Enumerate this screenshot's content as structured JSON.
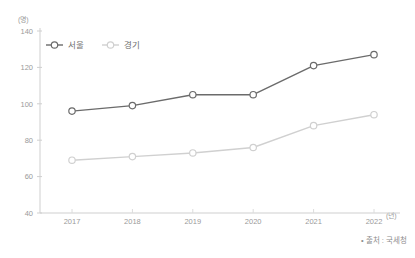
{
  "chart_data": {
    "type": "line",
    "title": "",
    "subtitle": "",
    "xlabel": "(년)",
    "ylabel": "(명)",
    "categories": [
      "2017",
      "2018",
      "2019",
      "2020",
      "2021",
      "2022"
    ],
    "series": [
      {
        "name": "서울",
        "color": "#6b6b6b",
        "values": [
          96,
          99,
          105,
          105,
          121,
          127
        ]
      },
      {
        "name": "경기",
        "color": "#d0d0d0",
        "values": [
          69,
          71,
          73,
          76,
          88,
          94
        ]
      }
    ],
    "ylim": [
      40,
      140
    ],
    "yticks": [
      40,
      60,
      80,
      100,
      120,
      140
    ],
    "grid": false,
    "legend_position": "top-left",
    "marker": "open-circle"
  },
  "axis": {
    "y_unit": "(명)",
    "x_unit": "(년)",
    "y_tick_labels": [
      "140",
      "120",
      "100",
      "80",
      "60",
      "40"
    ],
    "x_tick_labels": [
      "2017",
      "2018",
      "2019",
      "2020",
      "2021",
      "2022"
    ]
  },
  "legend": {
    "items": [
      {
        "label": "서울",
        "color": "#6b6b6b"
      },
      {
        "label": "경기",
        "color": "#d0d0d0"
      }
    ]
  },
  "footer": {
    "source": "• 출처 : 국세청"
  }
}
